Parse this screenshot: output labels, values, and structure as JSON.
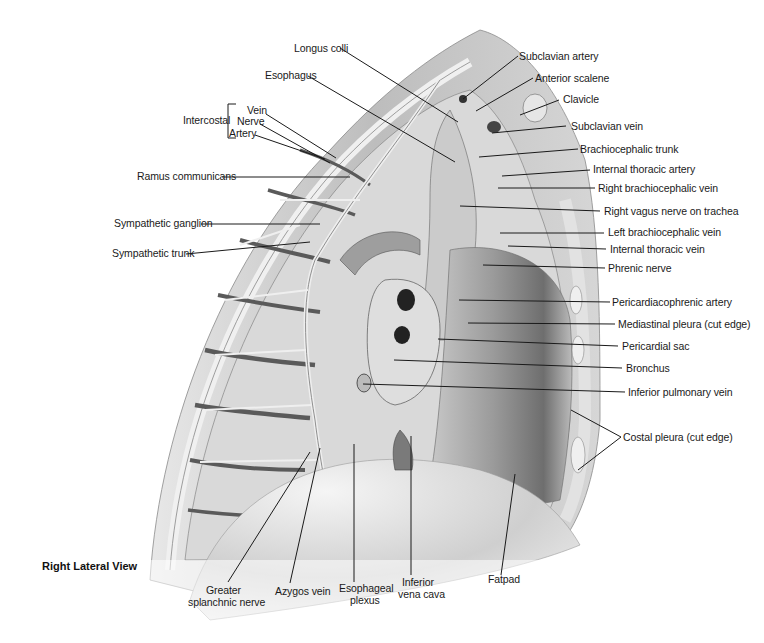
{
  "view_title": "Right Lateral View",
  "group_labels": {
    "intercostal": "Intercostal"
  },
  "labels": {
    "longus_colli": "Longus colli",
    "esophagus": "Esophagus",
    "intercostal_vein": "Vein",
    "intercostal_nerve": "Nerve",
    "intercostal_artery": "Artery",
    "ramus_communicans": "Ramus communicans",
    "sympathetic_ganglion": "Sympathetic ganglion",
    "sympathetic_trunk": "Sympathetic trunk",
    "subclavian_artery": "Subclavian artery",
    "anterior_scalene": "Anterior scalene",
    "clavicle": "Clavicle",
    "subclavian_vein": "Subclavian vein",
    "brachiocephalic_trunk": "Brachiocephalic trunk",
    "internal_thoracic_artery": "Internal thoracic artery",
    "right_brachiocephalic_vein": "Right brachiocephalic vein",
    "right_vagus_nerve": "Right vagus nerve on trachea",
    "left_brachiocephalic_vein": "Left brachiocephalic vein",
    "internal_thoracic_vein": "Internal thoracic vein",
    "phrenic_nerve": "Phrenic nerve",
    "pericardiacophrenic_artery": "Pericardiacophrenic artery",
    "mediastinal_pleura": "Mediastinal pleura (cut edge)",
    "pericardial_sac": "Pericardial sac",
    "bronchus": "Bronchus",
    "inferior_pulmonary_vein": "Inferior pulmonary vein",
    "costal_pleura": "Costal pleura (cut edge)",
    "greater_splanchnic_1": "Greater",
    "greater_splanchnic_2": "splanchnic nerve",
    "azygos_vein": "Azygos vein",
    "esophageal_plexus_1": "Esophageal",
    "esophageal_plexus_2": "plexus",
    "ivc_1": "Inferior",
    "ivc_2": "vena cava",
    "fatpad": "Fatpad"
  }
}
